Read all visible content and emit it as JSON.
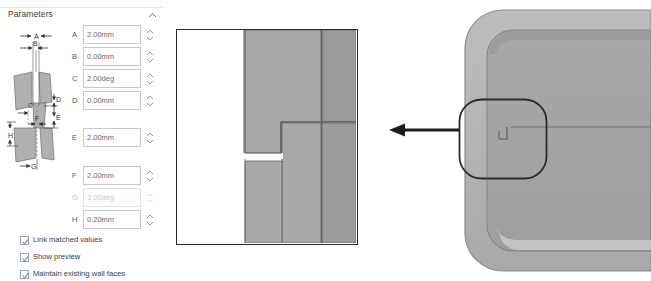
{
  "panel": {
    "title": "Parameters",
    "collapse_icon": "chevron-up-icon",
    "fields": [
      {
        "key": "A",
        "label": "A",
        "value": "2.00mm",
        "disabled": false,
        "top": 25
      },
      {
        "key": "B",
        "label": "B",
        "value": "0.00mm",
        "disabled": false,
        "top": 47
      },
      {
        "key": "C",
        "label": "C",
        "value": "2.00deg",
        "disabled": false,
        "top": 69
      },
      {
        "key": "D",
        "label": "D",
        "value": "0.00mm",
        "disabled": false,
        "top": 91
      },
      {
        "key": "E",
        "label": "E",
        "value": "2.00mm",
        "disabled": false,
        "top": 128
      },
      {
        "key": "F",
        "label": "F",
        "value": "2.00mm",
        "disabled": false,
        "top": 166
      },
      {
        "key": "G",
        "label": "G",
        "value": "3.00deg",
        "disabled": true,
        "top": 188
      },
      {
        "key": "H",
        "label": "H",
        "value": "0.20mm",
        "disabled": false,
        "top": 210
      }
    ],
    "checkboxes": [
      {
        "label": "Link matched values",
        "checked": true,
        "top": 235
      },
      {
        "label": "Show preview",
        "checked": true,
        "top": 252
      },
      {
        "label": "Maintain existing wall faces",
        "checked": true,
        "top": 269
      }
    ],
    "diagram": {
      "name": "parameters-dimension-diagram",
      "dimension_labels": [
        "A",
        "B",
        "C",
        "D",
        "E",
        "F",
        "G",
        "H"
      ]
    }
  },
  "preview": {
    "name": "section-preview",
    "description": "cross-section preview of lip and groove joint"
  },
  "arrow": {
    "name": "callout-arrow",
    "direction": "left"
  },
  "model": {
    "name": "3d-model-view",
    "description": "rounded rectangular shell part with lip groove"
  },
  "callout": {
    "name": "callout-region-ring",
    "shape": "rounded-rectangle"
  },
  "colors": {
    "face_light": "#adadad",
    "face_mid": "#a0a0a0",
    "face_dark": "#949494",
    "model_rim": "#b2b2b2",
    "model_inner": "#a6a6a6",
    "outline": "#4a4a4a",
    "panel_border": "#2b2b2b",
    "arrow": "#1c1c1c",
    "checkbox_border": "#9aa7b0",
    "field_border": "#c8c8c8",
    "text": "#3d3d3d",
    "text_muted": "#6a6a6a",
    "text_disabled": "#c9c9c9"
  }
}
